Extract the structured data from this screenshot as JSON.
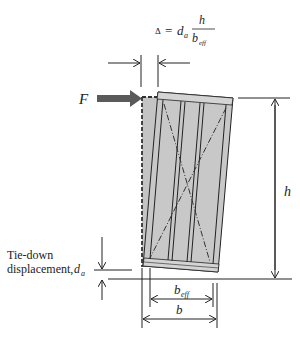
{
  "caption_clipped": "…g… …g…",
  "equation": {
    "lhs": "Δ",
    "equals": "=",
    "factor": "d",
    "factor_sub": "a",
    "numerator": "h",
    "denominator": "b",
    "denominator_sub": "eff"
  },
  "labels": {
    "force": "F",
    "height": "h",
    "tiedown_line1": "Tie-down",
    "tiedown_line2": "displacement, ",
    "tiedown_symbol": "d",
    "tiedown_sub": "a",
    "beff": "b",
    "beff_sub": "eff",
    "b": "b"
  },
  "colors": {
    "panel_fill": "#c8c8c8",
    "force_arrow": "#5a5a5a",
    "line": "#222222"
  }
}
